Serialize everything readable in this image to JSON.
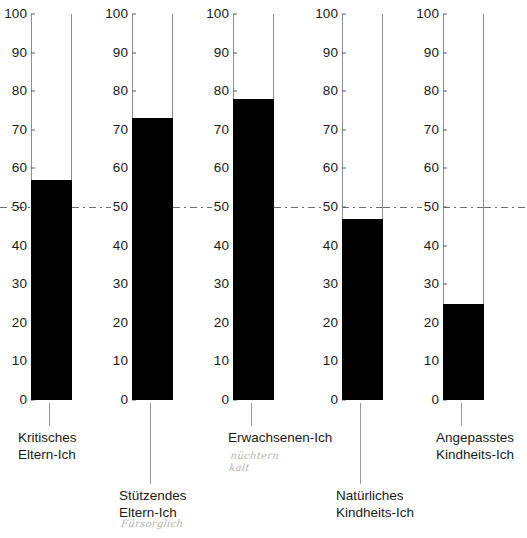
{
  "chart_data": {
    "type": "bar",
    "title": "",
    "subtitle": "",
    "xlabel": "",
    "ylabel": "",
    "ylim": [
      0,
      100
    ],
    "grid": false,
    "legend": "none",
    "orientation": "vertical",
    "separate_axis_per_bar": true,
    "tick_labels": [
      "0",
      "10",
      "20",
      "30",
      "40",
      "50",
      "60",
      "70",
      "80",
      "90",
      "100"
    ],
    "tick_values": [
      0,
      10,
      20,
      30,
      40,
      50,
      60,
      70,
      80,
      90,
      100
    ],
    "reference_line": {
      "value": 50,
      "label": "50",
      "style": "dash-dot",
      "color": "#6e6e6e"
    },
    "categories": [
      "Kritisches Eltern-Ich",
      "Stützendes Eltern-Ich",
      "Erwachsenen-Ich",
      "Natürliches Kindheits-Ich",
      "Angepasstes Kindheits-Ich"
    ],
    "values": [
      57,
      73,
      78,
      47,
      25
    ],
    "bar_color": "#000000",
    "axis_color": "#8d8d8d"
  },
  "columns": [
    {
      "name": "kritisches-eltern-ich",
      "value": 57,
      "caption_lines": [
        "Kritisches",
        "Eltern-Ich"
      ],
      "annotation_lines": []
    },
    {
      "name": "stuetzendes-eltern-ich",
      "value": 73,
      "caption_lines": [
        "Stützendes",
        "Eltern-Ich"
      ],
      "annotation_lines": [
        "Fürsorglich"
      ]
    },
    {
      "name": "erwachsenen-ich",
      "value": 78,
      "caption_lines": [
        "Erwachsenen-Ich"
      ],
      "annotation_lines": [
        "nüchtern",
        "kalt"
      ]
    },
    {
      "name": "natuerliches-kindheits-ich",
      "value": 47,
      "caption_lines": [
        "Natürliches",
        "Kindheits-Ich"
      ],
      "annotation_lines": []
    },
    {
      "name": "angepasstes-kindheits-ich",
      "value": 25,
      "caption_lines": [
        "Angepasstes",
        "Kindheits-Ich"
      ],
      "annotation_lines": []
    }
  ],
  "ticks": {
    "t0": "0",
    "t10": "10",
    "t20": "20",
    "t30": "30",
    "t40": "40",
    "t50": "50",
    "t60": "60",
    "t70": "70",
    "t80": "80",
    "t90": "90",
    "t100": "100"
  },
  "colors": {
    "bar": "#000000",
    "axis": "#8d8d8d",
    "reference": "#6e6e6e",
    "text": "#1a1a1a",
    "annotation": "#b4b0ab",
    "background": "#ffffff"
  }
}
